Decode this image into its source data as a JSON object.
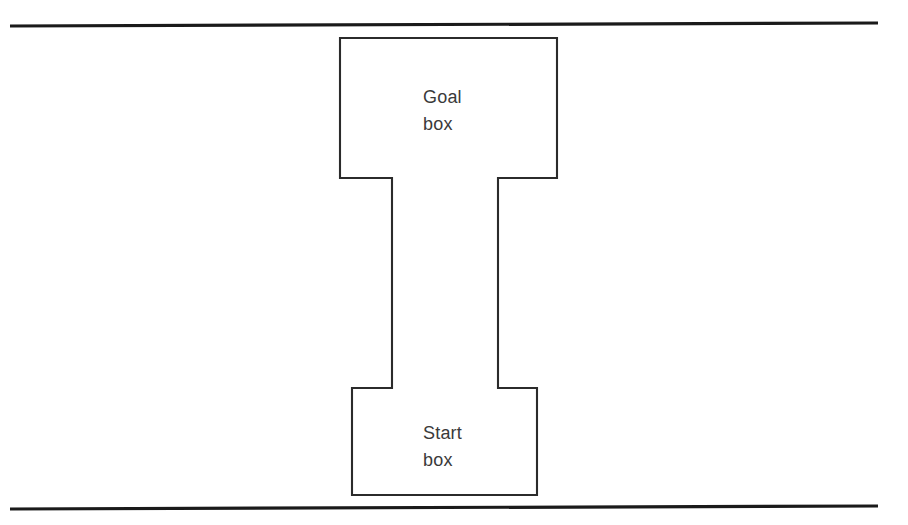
{
  "figure": {
    "type": "line-diagram",
    "background_color": "#ffffff",
    "line_color": "#2b2b2b",
    "rule_color": "#1a1a1a",
    "text_color": "#3a3a3a",
    "width": 908,
    "height": 525
  },
  "rules": {
    "top": {
      "name": "top-rule",
      "x1": 10,
      "y1": 26,
      "x2": 878,
      "y2": 23
    },
    "bottom": {
      "name": "bottom-rule",
      "x1": 10,
      "y1": 509,
      "x2": 878,
      "y2": 506
    }
  },
  "maze": {
    "outline_points": "340,38 557,38 557,178 498,178 498,388 537,388 537,495 352,495 352,388 392,388 392,178 340,178",
    "goal_box": {
      "label_line1": "Goal",
      "label_line2": "box",
      "left": 340,
      "top": 38,
      "right": 557,
      "bottom": 178
    },
    "corridor": {
      "left": 392,
      "top": 178,
      "right": 498,
      "bottom": 388
    },
    "start_box": {
      "label_line1": "Start",
      "label_line2": "box",
      "left": 352,
      "top": 388,
      "right": 537,
      "bottom": 495
    }
  },
  "labels": {
    "goal": "Goal\nbox",
    "start": "Start\nbox"
  }
}
